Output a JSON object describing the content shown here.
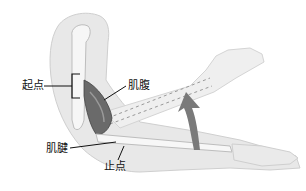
{
  "diagram": {
    "title": "",
    "labels": {
      "origin": "起点",
      "muscle_belly": "肌腹",
      "tendon": "肌腱",
      "insertion": "止点"
    },
    "colors": {
      "skin": "#e6e6e6",
      "skin_outline": "#c8c8c8",
      "bone": "#f4f4f4",
      "muscle_dark": "#5a5a5a",
      "muscle_mid": "#8a8a8a",
      "arrow": "#7a7a7a",
      "leader": "#111111"
    }
  }
}
